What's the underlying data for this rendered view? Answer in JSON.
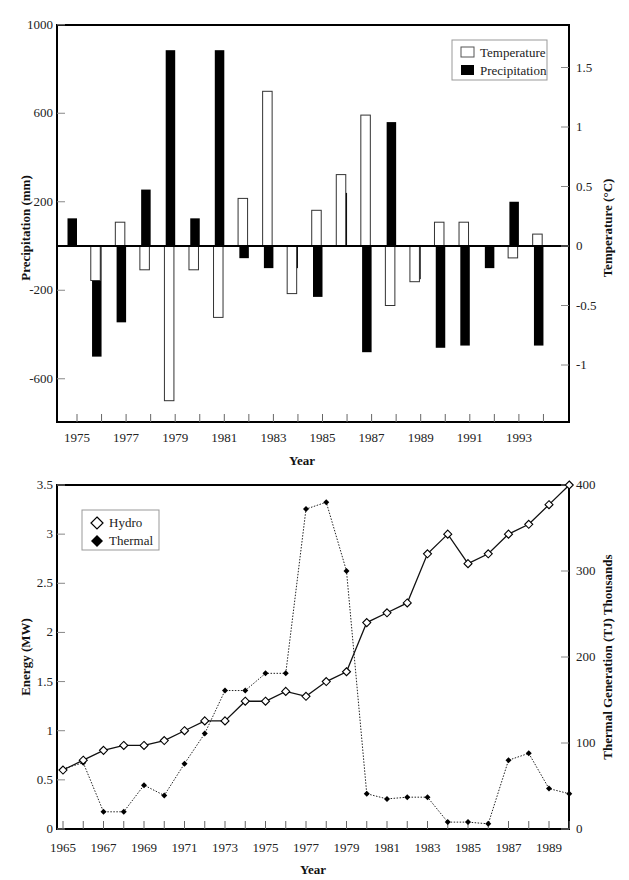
{
  "chart_data": [
    {
      "type": "bar",
      "title": "",
      "xlabel": "Year",
      "ylabel": "Precipitation (mm)",
      "y2label": "Temperature (°C)",
      "ylim": [
        -800,
        1000
      ],
      "y2lim": [
        -1.37,
        1.83
      ],
      "yticks": [
        "1000",
        "600",
        "200",
        "-200",
        "-600"
      ],
      "y2ticks": [
        "1.5",
        "1",
        "0.5",
        "0",
        "-0.5",
        "-1"
      ],
      "xticks": [
        "1975",
        "1977",
        "1979",
        "1981",
        "1983",
        "1985",
        "1987",
        "1989",
        "1991",
        "1993"
      ],
      "legend_position": "top-right",
      "grid": false,
      "categories": [
        1975,
        1976,
        1977,
        1978,
        1979,
        1980,
        1981,
        1982,
        1983,
        1984,
        1985,
        1986,
        1987,
        1988,
        1989,
        1990,
        1991,
        1992,
        1993,
        1994
      ],
      "series": [
        {
          "name": "Temperature",
          "axis": "right",
          "fill": "#ffffff",
          "unit": "°C",
          "values": [
            null,
            -0.29,
            0.2,
            -0.2,
            -1.3,
            -0.2,
            -0.6,
            0.4,
            1.3,
            -0.4,
            0.3,
            0.6,
            1.1,
            -0.5,
            -0.3,
            0.2,
            0.2,
            null,
            -0.1,
            0.1
          ]
        },
        {
          "name": "Precipitation",
          "axis": "left",
          "fill": "#000000",
          "unit": "mm",
          "values": [
            125,
            -500,
            -345,
            255,
            885,
            125,
            885,
            -55,
            -100,
            -100,
            -230,
            240,
            -480,
            560,
            -150,
            -460,
            -450,
            -100,
            200,
            -450
          ]
        }
      ]
    },
    {
      "type": "line",
      "title": "",
      "xlabel": "Year",
      "ylabel": "Energy (MW)",
      "y2label": "Thermal Generation (TJ) Thousands",
      "ylim": [
        0,
        3.5
      ],
      "y2lim": [
        0,
        400
      ],
      "yticks": [
        "3.5",
        "3",
        "2.5",
        "2",
        "1.5",
        "1",
        "0.5",
        "0"
      ],
      "y2ticks": [
        "400",
        "300",
        "200",
        "100",
        "0"
      ],
      "xticks": [
        "1965",
        "1967",
        "1969",
        "1971",
        "1973",
        "1975",
        "1977",
        "1979",
        "1981",
        "1983",
        "1985",
        "1987",
        "1989"
      ],
      "legend_position": "top-left",
      "grid": false,
      "x": [
        1965,
        1966,
        1967,
        1968,
        1969,
        1970,
        1971,
        1972,
        1973,
        1974,
        1975,
        1976,
        1977,
        1978,
        1979,
        1980,
        1981,
        1982,
        1983,
        1984,
        1985,
        1986,
        1987,
        1988,
        1989,
        1990
      ],
      "series": [
        {
          "name": "Hydro",
          "axis": "left",
          "marker": "open-diamond",
          "line": "solid",
          "values": [
            0.6,
            0.7,
            0.8,
            0.85,
            0.85,
            0.9,
            1.0,
            1.1,
            1.1,
            1.3,
            1.3,
            1.4,
            1.35,
            1.5,
            1.6,
            2.1,
            2.2,
            2.3,
            2.8,
            3.0,
            2.7,
            2.8,
            3.0,
            3.1,
            3.3,
            3.5
          ]
        },
        {
          "name": "Thermal",
          "axis": "right",
          "marker": "filled-diamond",
          "line": "dotted",
          "values": [
            70,
            77,
            20,
            20,
            51,
            39,
            76,
            111,
            161,
            161,
            181,
            181,
            372,
            380,
            300,
            41,
            35,
            37,
            37,
            8,
            8,
            6,
            80,
            88,
            47,
            41
          ]
        }
      ]
    }
  ],
  "top_chart": {
    "legend": {
      "temperature": "Temperature",
      "precipitation": "Precipitation"
    },
    "xlabel": "Year",
    "ylabel": "Precipitation (mm)",
    "y2label": "Temperature (°C)"
  },
  "bottom_chart": {
    "legend": {
      "hydro": "Hydro",
      "thermal": "Thermal"
    },
    "xlabel": "Year",
    "ylabel": "Energy (MW)",
    "y2label": "Thermal Generation (TJ) Thousands"
  }
}
